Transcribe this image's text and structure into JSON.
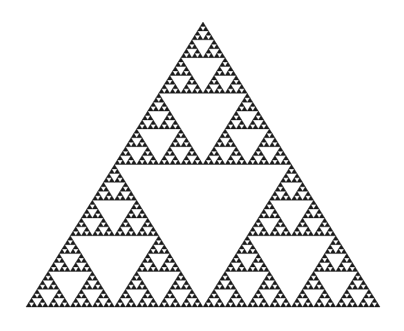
{
  "figure": {
    "type": "fractal",
    "canvas": {
      "width": 404,
      "height": 331,
      "background_color": "#ffffff"
    },
    "fill_color": "#1a1a1a",
    "stroke_color": "#1a1a1a",
    "vertices": {
      "apex": {
        "x": 203,
        "y": 22
      },
      "left": {
        "x": 26,
        "y": 307
      },
      "right": {
        "x": 380,
        "y": 307
      }
    },
    "base_width": 354,
    "height_px": 285,
    "recursion_depth": 6,
    "subdivision_rule": "midpoint-triangle-removal",
    "sub_triangles_per_level": 3,
    "filled_triangle_count": 729,
    "removed_hole_count": 364
  }
}
